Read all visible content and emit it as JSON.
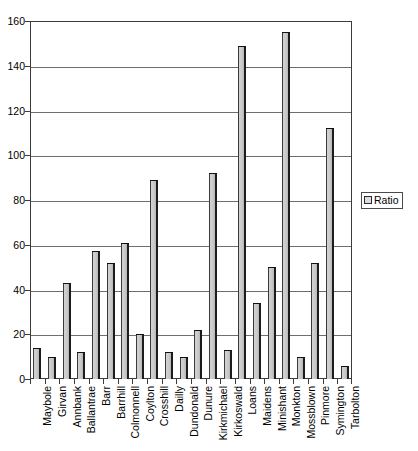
{
  "chart_data": {
    "type": "bar",
    "title": "",
    "xlabel": "",
    "ylabel": "",
    "ylim": [
      0,
      160
    ],
    "ytick_step": 20,
    "yticks": [
      0,
      20,
      40,
      60,
      80,
      100,
      120,
      140,
      160
    ],
    "grid": true,
    "legend_position": "right",
    "legend": [
      "Ratio"
    ],
    "series_name": "Ratio",
    "categories": [
      "Maybole",
      "Girvan",
      "Annbank",
      "Ballantrae",
      "Barr",
      "Barrhill",
      "Colmonnell",
      "Coylton",
      "Crosshill",
      "Dailly",
      "Dundonald",
      "Dunure",
      "Kirkmichael",
      "Kirkoswald",
      "Loans",
      "Maidens",
      "Minishant",
      "Monkton",
      "Mossblown",
      "Pinmore",
      "Symington",
      "Tarbolton"
    ],
    "values": [
      14,
      10,
      43,
      12,
      57,
      52,
      61,
      20,
      89,
      12,
      10,
      22,
      92,
      13,
      149,
      34,
      50,
      155,
      10,
      52,
      112,
      6
    ],
    "series": [
      {
        "name": "Ratio",
        "values": [
          14,
          10,
          43,
          12,
          57,
          52,
          61,
          20,
          89,
          12,
          10,
          22,
          92,
          13,
          149,
          34,
          50,
          155,
          10,
          52,
          112,
          6
        ]
      }
    ],
    "colors": {
      "bar_fill": "#cccccc",
      "bar_edge": "#1c1c1c",
      "gridline": "#6e6e6e",
      "frame": "#3c3c3c",
      "background": "#ffffff"
    }
  },
  "legend": {
    "entry_label": "Ratio",
    "swatch_icon": "square-swatch-icon"
  }
}
